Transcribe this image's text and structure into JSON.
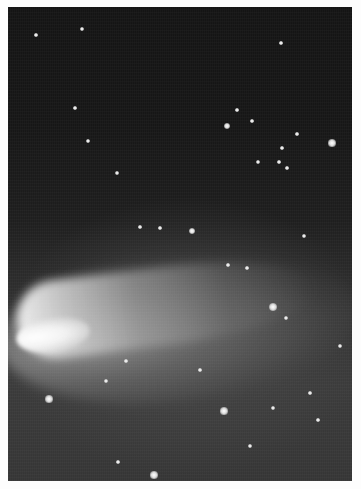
{
  "image": {
    "subject": "comet-in-night-sky",
    "description": "Black-and-white photograph of a comet with a bright head at lower left and a broad diffuse tail extending to the right across a star field",
    "border_color": "#fdfdfd",
    "sky_color_top": "#141414",
    "sky_color_bottom": "#353535",
    "comet": {
      "head": {
        "x": 22,
        "y": 333
      },
      "tail_direction": "right-and-slightly-up",
      "tail_end": {
        "x": 300,
        "y": 290
      }
    },
    "stars": [
      {
        "x": 36,
        "y": 35,
        "r": 1.5
      },
      {
        "x": 82,
        "y": 29,
        "r": 2
      },
      {
        "x": 281,
        "y": 43,
        "r": 1.5
      },
      {
        "x": 75,
        "y": 108,
        "r": 1.5
      },
      {
        "x": 88,
        "y": 141,
        "r": 2
      },
      {
        "x": 117,
        "y": 173,
        "r": 2
      },
      {
        "x": 227,
        "y": 126,
        "r": 2.5
      },
      {
        "x": 237,
        "y": 110,
        "r": 1.5
      },
      {
        "x": 252,
        "y": 121,
        "r": 1.5
      },
      {
        "x": 282,
        "y": 148,
        "r": 1.5
      },
      {
        "x": 297,
        "y": 134,
        "r": 1.5
      },
      {
        "x": 332,
        "y": 143,
        "r": 3
      },
      {
        "x": 258,
        "y": 162,
        "r": 2
      },
      {
        "x": 279,
        "y": 162,
        "r": 1.5
      },
      {
        "x": 287,
        "y": 168,
        "r": 1.5
      },
      {
        "x": 192,
        "y": 231,
        "r": 2.5
      },
      {
        "x": 160,
        "y": 228,
        "r": 1.5
      },
      {
        "x": 140,
        "y": 227,
        "r": 1.5
      },
      {
        "x": 304,
        "y": 236,
        "r": 2
      },
      {
        "x": 228,
        "y": 265,
        "r": 1.5
      },
      {
        "x": 247,
        "y": 268,
        "r": 1.5
      },
      {
        "x": 273,
        "y": 307,
        "r": 3.5
      },
      {
        "x": 286,
        "y": 318,
        "r": 2
      },
      {
        "x": 340,
        "y": 346,
        "r": 2
      },
      {
        "x": 126,
        "y": 361,
        "r": 1.5
      },
      {
        "x": 106,
        "y": 381,
        "r": 2
      },
      {
        "x": 49,
        "y": 399,
        "r": 3
      },
      {
        "x": 224,
        "y": 411,
        "r": 3
      },
      {
        "x": 273,
        "y": 408,
        "r": 2
      },
      {
        "x": 318,
        "y": 420,
        "r": 1.5
      },
      {
        "x": 250,
        "y": 446,
        "r": 2
      },
      {
        "x": 154,
        "y": 475,
        "r": 3
      },
      {
        "x": 118,
        "y": 462,
        "r": 1.5
      },
      {
        "x": 310,
        "y": 393,
        "r": 1.5
      },
      {
        "x": 200,
        "y": 370,
        "r": 1.5
      }
    ]
  }
}
